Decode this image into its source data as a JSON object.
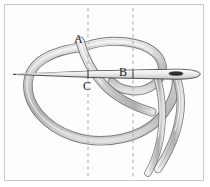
{
  "figure": {
    "type": "technical-line-illustration",
    "background_color": "#fdfdfd",
    "border_color": "#c9c9c9",
    "ink_color": "#4a4a4a",
    "thread_fill": "#d9d9d9",
    "thread_outline": "#6b6b6b",
    "needle_fill": "#e6e6e6",
    "needle_outline": "#3a3a3a",
    "guide_line_color": "#b3b3b3"
  },
  "labels": {
    "a": "A",
    "b": "B",
    "c": "C"
  },
  "guides": [
    {
      "name": "left-guide",
      "x": 88
    },
    {
      "name": "right-guide",
      "x": 133
    }
  ],
  "points": [
    {
      "name": "A",
      "x": 82,
      "y": 45
    },
    {
      "name": "B",
      "x": 133,
      "y": 74
    },
    {
      "name": "C",
      "x": 88,
      "y": 74
    }
  ],
  "needle": {
    "name": "sewing-needle",
    "tip_x": 14,
    "eye_x": 185,
    "axis_y": 74
  }
}
